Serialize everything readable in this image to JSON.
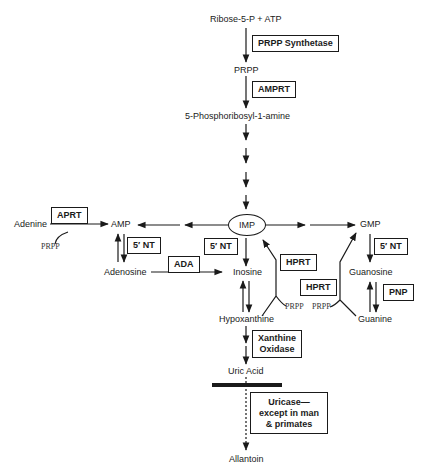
{
  "diagram": {
    "nodes": {
      "ribose": "Ribose-5-P + ATP",
      "prpp": "PRPP",
      "phosphoribosylamine": "5-Phosphoribosyl-1-amine",
      "imp": "IMP",
      "amp": "AMP",
      "gmp": "GMP",
      "adenine": "Adenine",
      "adenosine": "Adenosine",
      "inosine": "Inosine",
      "guanosine": "Guanosine",
      "hypoxanthine": "Hypoxanthine",
      "guanine": "Guanine",
      "uric_acid": "Uric Acid",
      "allantoin": "Allantoin"
    },
    "enzymes": {
      "prpp_synthetase": "PRPP Synthetase",
      "amprt": "AMPRT",
      "aprt": "APRT",
      "nt_amp": "5′ NT",
      "nt_imp": "5′ NT",
      "nt_gmp": "5′ NT",
      "ada": "ADA",
      "hprt_inosine": "HPRT",
      "hprt_guanine": "HPRT",
      "pnp": "PNP",
      "xanthine_oxidase_1": "Xanthine",
      "xanthine_oxidase_2": "Oxidase",
      "uricase_1": "Uricase—",
      "uricase_2": "except in man",
      "uricase_3": "& primates"
    },
    "cofactors": {
      "prpp_adenine": "PRPP",
      "prpp_hypoxanthine": "PRPP",
      "prpp_guanine": "PRPP"
    },
    "colors": {
      "line": "#1a1a1a",
      "background": "#ffffff"
    }
  }
}
